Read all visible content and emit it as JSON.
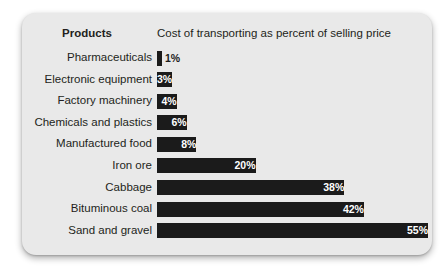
{
  "chart_data": {
    "type": "bar",
    "orientation": "horizontal",
    "title": "",
    "xlabel": "Cost of transporting as percent of selling price",
    "ylabel": "Products",
    "categories": [
      "Pharmaceuticals",
      "Electronic equipment",
      "Factory machinery",
      "Chemicals and plastics",
      "Manufactured food",
      "Iron ore",
      "Cabbage",
      "Bituminous coal",
      "Sand and gravel"
    ],
    "values": [
      1,
      3,
      4,
      6,
      8,
      20,
      38,
      42,
      55
    ],
    "value_labels": [
      "1%",
      "3%",
      "4%",
      "6%",
      "8%",
      "20%",
      "38%",
      "42%",
      "55%"
    ],
    "label_placement": [
      "outside",
      "inside",
      "inside",
      "inside",
      "inside",
      "inside",
      "inside",
      "inside",
      "inside"
    ],
    "xlim": [
      0,
      55
    ],
    "grid": false,
    "legend": null,
    "bar_color": "#1b1b1b",
    "card_color": "#e9e9e9",
    "text_color": "#231f20",
    "inside_label_color": "#ffffff"
  },
  "header": {
    "products_label": "Products",
    "cost_label": "Cost of transporting as percent of selling price"
  }
}
